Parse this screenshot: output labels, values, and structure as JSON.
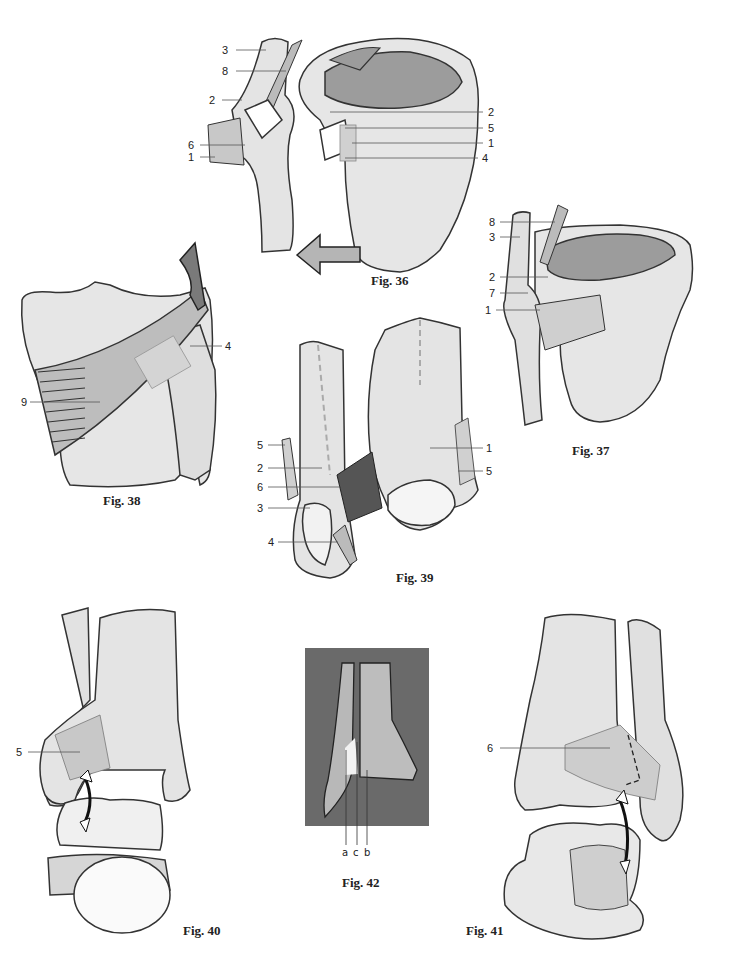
{
  "page": {
    "background": "#ffffff",
    "bone_fill": "#e4e4e4",
    "bone_stroke": "#333333",
    "ligament_fill": "#c8c8c8",
    "arrow_fill": "#8a8a8a",
    "fig42_background": "#6a6a6a"
  },
  "figures": [
    {
      "id": "fig36",
      "caption": "Fig. 36",
      "labels_left": [
        "3",
        "8",
        "2",
        "6",
        "1"
      ],
      "labels_right": [
        "2",
        "5",
        "1",
        "4"
      ]
    },
    {
      "id": "fig37",
      "caption": "Fig. 37",
      "labels_left": [
        "8",
        "3",
        "2",
        "7",
        "1"
      ]
    },
    {
      "id": "fig38",
      "caption": "Fig. 38",
      "labels_left": [
        "9"
      ],
      "labels_right": [
        "4"
      ]
    },
    {
      "id": "fig39",
      "caption": "Fig. 39",
      "labels_left": [
        "5",
        "2",
        "6",
        "3",
        "4"
      ],
      "labels_right": [
        "1",
        "5"
      ]
    },
    {
      "id": "fig40",
      "caption": "Fig. 40",
      "labels_left": [
        "5"
      ]
    },
    {
      "id": "fig41",
      "caption": "Fig. 41",
      "labels_left": [
        "6"
      ]
    },
    {
      "id": "fig42",
      "caption": "Fig. 42",
      "labels_bottom": [
        "a",
        "c",
        "b"
      ]
    }
  ]
}
